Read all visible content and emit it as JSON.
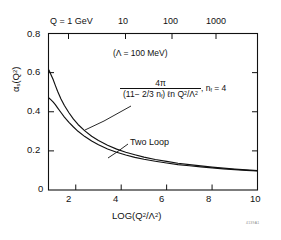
{
  "chart_data": {
    "type": "line",
    "title": "",
    "xlabel": "LOG(Q2/Λ2)",
    "ylabel": "αs(Q2)",
    "xlim": [
      0.8,
      10
    ],
    "ylim": [
      0,
      0.8
    ],
    "grid": false,
    "legend": "inline-annotation",
    "x_ticks": [
      "2",
      "4",
      "6",
      "8",
      "10"
    ],
    "x_tick_values": [
      2,
      4,
      6,
      8,
      10
    ],
    "y_ticks": [
      "0",
      "0.2",
      "0.4",
      "0.6",
      "0.8"
    ],
    "y_tick_values": [
      0,
      0.2,
      0.4,
      0.6,
      0.8
    ],
    "top_axis": {
      "label": "Q = 1 GeV",
      "ticks": [
        "Q = 1 GeV",
        "10",
        "100",
        "1000"
      ],
      "tick_values": [
        1,
        10,
        100,
        1000
      ]
    },
    "annotations": {
      "lambda_note": "(Λ = 100 MeV)",
      "two_loop": "Two Loop",
      "nf_note": ", n",
      "nf_sub": "f",
      "nf_eq": " = 4",
      "formula_numerator": "4π",
      "formula_denominator_a": "(11− 2/3 n",
      "formula_denominator_b": "f",
      "formula_denominator_c": ") ℓn Q",
      "formula_denominator_sup": "2",
      "formula_denominator_d": "/Λ",
      "formula_denominator_sup2": "2"
    },
    "figure_id": "4139A1",
    "series": [
      {
        "name": "One Loop",
        "formula": "4π / ((11 - 2/3 nf) ln(Q2/Λ2)), nf = 4",
        "x": [
          0.82,
          0.9,
          1.0,
          1.1,
          1.2,
          1.35,
          1.5,
          1.7,
          1.9,
          2.1,
          2.4,
          2.7,
          3.0,
          3.4,
          3.8,
          4.2,
          4.6,
          5.0,
          5.5,
          6.0,
          6.5,
          7.0,
          7.5,
          8.0,
          8.5,
          9.0,
          9.5,
          10.0
        ],
        "y": [
          0.613,
          0.592,
          0.566,
          0.535,
          0.505,
          0.465,
          0.432,
          0.395,
          0.362,
          0.335,
          0.302,
          0.275,
          0.253,
          0.229,
          0.209,
          0.193,
          0.18,
          0.168,
          0.156,
          0.146,
          0.137,
          0.13,
          0.123,
          0.117,
          0.112,
          0.107,
          0.103,
          0.099
        ]
      },
      {
        "name": "Two Loop",
        "x": [
          0.82,
          0.9,
          1.0,
          1.1,
          1.2,
          1.35,
          1.5,
          1.7,
          1.9,
          2.1,
          2.4,
          2.7,
          3.0,
          3.4,
          3.8,
          4.2,
          4.6,
          5.0,
          5.5,
          6.0,
          6.5,
          7.0,
          7.5,
          8.0,
          8.5,
          9.0,
          9.5,
          10.0
        ],
        "y": [
          0.47,
          0.462,
          0.45,
          0.436,
          0.42,
          0.396,
          0.373,
          0.346,
          0.322,
          0.3,
          0.273,
          0.25,
          0.231,
          0.21,
          0.193,
          0.179,
          0.167,
          0.157,
          0.147,
          0.138,
          0.13,
          0.124,
          0.118,
          0.113,
          0.108,
          0.104,
          0.1,
          0.097
        ]
      }
    ],
    "colors": {
      "axis": "#111111",
      "curve": "#111111",
      "background": "#ffffff"
    }
  }
}
